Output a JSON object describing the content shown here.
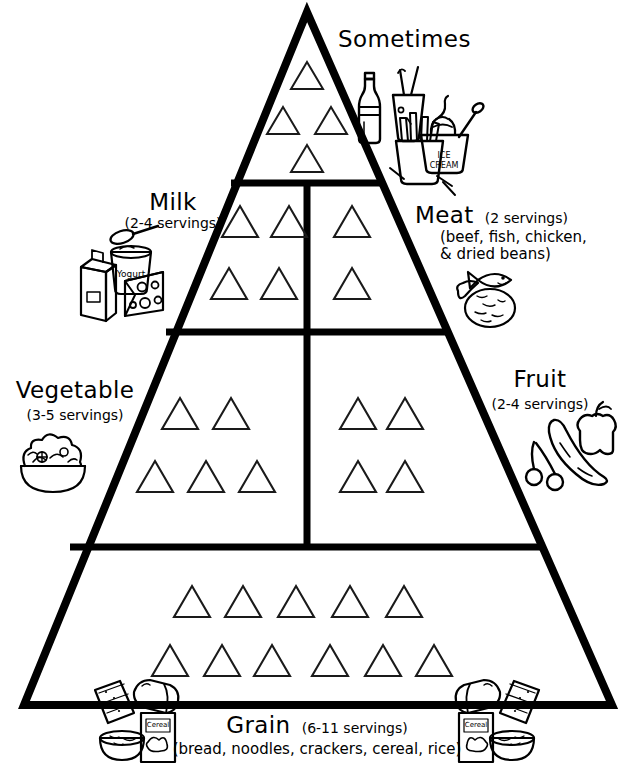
{
  "diagram": {
    "style": "black-and-white line drawing, coloring-book style",
    "stroke_color": "#000000",
    "background_color": "#ffffff"
  },
  "levels": [
    {
      "id": "sometimes",
      "name": "Sometimes",
      "servings": "",
      "subtitle": "",
      "label_position": "right-of-apex",
      "triangle_rows": [
        1,
        2,
        1
      ],
      "triangle_count": 4,
      "icons": [
        {
          "name": "soda-bottle-icon",
          "label": "soda bottle"
        },
        {
          "name": "soda-cup-icon",
          "label": "soda cup with straw"
        },
        {
          "name": "ice-cream-tub-icon",
          "label": "ICE CREAM"
        },
        {
          "name": "french-fries-icon",
          "label": "french fries"
        }
      ]
    },
    {
      "id": "milk",
      "name": "Milk",
      "servings": "(2-4 servings)",
      "subtitle": "",
      "label_position": "left",
      "triangle_rows": [
        2,
        2
      ],
      "triangle_count": 4,
      "icons": [
        {
          "name": "spoon-icon",
          "label": "spoon"
        },
        {
          "name": "yogurt-cup-icon",
          "label": "Yogurt"
        },
        {
          "name": "milk-carton-icon",
          "label": "milk carton"
        },
        {
          "name": "cheese-wedge-icon",
          "label": "cheese wedge"
        }
      ]
    },
    {
      "id": "meat",
      "name": "Meat",
      "servings": "(2 servings)",
      "subtitle": "(beef, fish, chicken,\n& dried beans)",
      "subtitle_line1": "(beef, fish, chicken,",
      "subtitle_line2": "& dried beans)",
      "label_position": "right",
      "triangle_rows": [
        1,
        1
      ],
      "triangle_count": 2,
      "icons": [
        {
          "name": "fish-icon",
          "label": "fish"
        },
        {
          "name": "chicken-drumstick-icon",
          "label": "chicken drumstick"
        },
        {
          "name": "beans-bowl-icon",
          "label": "dried beans"
        }
      ]
    },
    {
      "id": "vegetable",
      "name": "Vegetable",
      "servings": "(3-5 servings)",
      "subtitle": "",
      "label_position": "left",
      "triangle_rows": [
        2,
        3
      ],
      "triangle_count": 5,
      "icons": [
        {
          "name": "salad-bowl-icon",
          "label": "salad bowl"
        }
      ]
    },
    {
      "id": "fruit",
      "name": "Fruit",
      "servings": "(2-4 servings)",
      "subtitle": "",
      "label_position": "right",
      "triangle_rows": [
        2,
        2
      ],
      "triangle_count": 4,
      "icons": [
        {
          "name": "cherries-icon",
          "label": "cherries"
        },
        {
          "name": "banana-icon",
          "label": "banana"
        },
        {
          "name": "apple-icon",
          "label": "apple"
        }
      ]
    },
    {
      "id": "grain",
      "name": "Grain",
      "servings": "(6-11 servings)",
      "subtitle": "(bread, noodles, crackers, cereal, rice)",
      "label_position": "bottom-center",
      "triangle_rows": [
        5,
        6
      ],
      "triangle_count": 11,
      "icons": [
        {
          "name": "crackers-icon",
          "label": "crackers"
        },
        {
          "name": "bread-loaf-icon",
          "label": "bread loaf"
        },
        {
          "name": "cereal-box-icon",
          "label": "cereal box"
        },
        {
          "name": "cereal-bowl-icon",
          "label": "cereal bowl"
        },
        {
          "name": "crackers-icon",
          "label": "crackers"
        },
        {
          "name": "bread-loaf-icon",
          "label": "bread loaf"
        },
        {
          "name": "cereal-box-icon",
          "label": "cereal box"
        },
        {
          "name": "cereal-bowl-icon",
          "label": "cereal bowl"
        }
      ]
    }
  ],
  "labels": {
    "sometimes": {
      "name": "Sometimes",
      "servings": ""
    },
    "milk": {
      "name": "Milk",
      "servings": "(2-4 servings)"
    },
    "meat": {
      "name": "Meat",
      "servings": "(2 servings)",
      "sub1": "(beef, fish, chicken,",
      "sub2": "& dried beans)"
    },
    "vegetable": {
      "name": "Vegetable",
      "servings": "(3-5 servings)"
    },
    "fruit": {
      "name": "Fruit",
      "servings": "(2-4 servings)"
    },
    "grain": {
      "name": "Grain",
      "servings": "(6-11 servings)",
      "sub1": "(bread, noodles, crackers, cereal, rice)"
    }
  },
  "icon_text": {
    "yogurt": "Yogurt",
    "ice_cream_line1": "ICE",
    "ice_cream_line2": "CREAM",
    "cereal_box": "Cereal"
  }
}
